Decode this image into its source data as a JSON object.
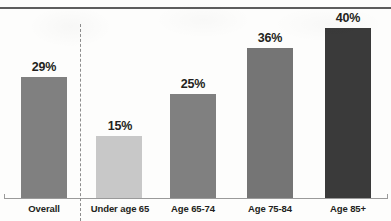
{
  "chart_data": {
    "type": "bar",
    "title": "",
    "subtitle": "",
    "xlabel": "",
    "ylabel": "",
    "ylim": [
      0,
      45
    ],
    "grid": false,
    "legend": false,
    "value_suffix": "%",
    "categories": [
      "Overall",
      "Under age 65",
      "Age 65-74",
      "Age 75-84",
      "Age 85+"
    ],
    "values": [
      29,
      15,
      25,
      36,
      40
    ],
    "value_labels": [
      "29%",
      "15%",
      "25%",
      "36%",
      "40%"
    ],
    "bar_colors": [
      "#808080",
      "#c8c8c8",
      "#808080",
      "#757575",
      "#3a3a3a"
    ],
    "annotations": [
      {
        "name": "overall-divider",
        "type": "vertical-dashed-line",
        "after_category": "Overall"
      }
    ]
  },
  "bars": [
    {
      "label": "Overall",
      "value": 29,
      "value_label": "29%",
      "color": "#808080",
      "left": 21,
      "width": 46,
      "top": 77,
      "height": 122,
      "label_left": 6,
      "label_width": 76
    },
    {
      "label": "Under age 65",
      "value": 15,
      "value_label": "15%",
      "color": "#c8c8c8",
      "left": 96,
      "width": 46,
      "top": 136,
      "height": 63,
      "label_left": 82,
      "label_width": 76
    },
    {
      "label": "Age 65-74",
      "value": 25,
      "value_label": "25%",
      "color": "#808080",
      "left": 170,
      "width": 46,
      "top": 94,
      "height": 105,
      "label_left": 155,
      "label_width": 76
    },
    {
      "label": "Age 75-84",
      "value": 36,
      "value_label": "36%",
      "color": "#757575",
      "left": 247,
      "width": 46,
      "top": 48,
      "height": 151,
      "label_left": 232,
      "label_width": 76
    },
    {
      "label": "Age 85+",
      "value": 40,
      "value_label": "40%",
      "color": "#3a3a3a",
      "left": 325,
      "width": 46,
      "top": 28,
      "height": 171,
      "label_left": 310,
      "label_width": 76
    }
  ]
}
